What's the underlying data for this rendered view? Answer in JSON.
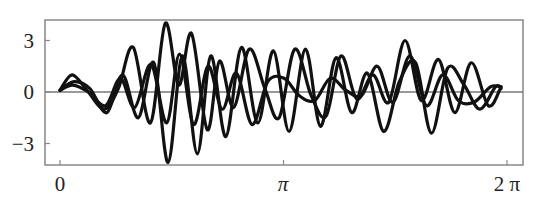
{
  "chart_data": {
    "type": "line",
    "title": "",
    "xlabel": "",
    "ylabel": "",
    "xlim": [
      0,
      6.2832
    ],
    "ylim": [
      -4.2,
      4.2
    ],
    "grid": false,
    "legend": null,
    "zero_line": true,
    "x_ticks": [
      {
        "value": 0,
        "label": "0"
      },
      {
        "value": 3.1416,
        "label": "π"
      },
      {
        "value": 6.2832,
        "label": "2 π"
      }
    ],
    "y_ticks": [
      {
        "value": 3,
        "label": "3"
      },
      {
        "value": 0,
        "label": "0"
      },
      {
        "value": -3,
        "label": "−3"
      }
    ],
    "stroke_color": "#111111",
    "frame_color": "#888888",
    "series": [
      {
        "name": "curve-1",
        "x": [
          0.0,
          0.17,
          0.38,
          0.62,
          0.82,
          1.03,
          1.27,
          1.48,
          1.67,
          1.85,
          2.07,
          2.24,
          2.44,
          2.66,
          2.88,
          3.08,
          3.3,
          3.53,
          3.74,
          3.95,
          4.17,
          4.4,
          4.62,
          4.85,
          5.08,
          5.32,
          5.55,
          5.78,
          6.02,
          6.2
        ],
        "y": [
          0.1,
          1.0,
          0.1,
          -1.0,
          0.2,
          2.6,
          -1.8,
          4.0,
          0.4,
          3.4,
          -2.2,
          1.8,
          -0.9,
          2.5,
          0.2,
          -1.5,
          2.5,
          -0.2,
          -1.4,
          2.1,
          -0.4,
          1.0,
          -0.6,
          3.0,
          -0.5,
          1.9,
          -1.2,
          1.7,
          -0.8,
          0.3
        ]
      },
      {
        "name": "curve-2",
        "x": [
          0.0,
          0.2,
          0.42,
          0.66,
          0.88,
          1.1,
          1.32,
          1.52,
          1.72,
          1.93,
          2.12,
          2.33,
          2.55,
          2.78,
          3.0,
          3.22,
          3.45,
          3.66,
          3.88,
          4.1,
          4.32,
          4.55,
          4.77,
          5.0,
          5.22,
          5.45,
          5.68,
          5.9,
          6.12,
          6.2
        ],
        "y": [
          0.1,
          0.6,
          0.2,
          -1.2,
          1.0,
          -1.5,
          1.7,
          -4.1,
          2.1,
          -3.6,
          2.1,
          -2.6,
          2.6,
          -1.8,
          2.4,
          -2.3,
          2.5,
          -2.0,
          2.0,
          -1.2,
          1.1,
          -2.3,
          0.6,
          1.7,
          -2.4,
          1.4,
          0.4,
          -1.0,
          0.3,
          0.2
        ]
      },
      {
        "name": "curve-3",
        "x": [
          0.0,
          0.18,
          0.4,
          0.64,
          0.85,
          1.05,
          1.28,
          1.5,
          1.68,
          1.88,
          2.08,
          2.28,
          2.48,
          2.7,
          2.92,
          3.15,
          3.36,
          3.58,
          3.8,
          4.02,
          4.24,
          4.46,
          4.68,
          4.92,
          5.15,
          5.38,
          5.6,
          5.82,
          6.05,
          6.2
        ],
        "y": [
          0.1,
          0.4,
          0.0,
          -0.8,
          0.8,
          -0.9,
          1.6,
          -1.8,
          2.2,
          -1.9,
          1.5,
          -1.0,
          1.1,
          -1.9,
          0.6,
          0.8,
          -0.2,
          -0.5,
          0.8,
          0.1,
          -0.2,
          1.5,
          -0.6,
          2.1,
          -0.8,
          1.0,
          -0.5,
          -0.6,
          0.3,
          0.3
        ]
      }
    ]
  }
}
